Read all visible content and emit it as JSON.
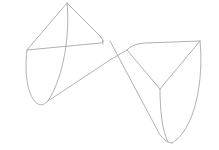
{
  "drawing": {
    "description": "Line sketch of two cone-shaped lobes joined diagonally (wireframe)",
    "stroke_color": "#a8a8a8",
    "stroke_width": 0.9,
    "background": "#ffffff",
    "paths": [
      {
        "name": "left-lobe-apex-to-left-edge",
        "d": "M67,3 L27,50"
      },
      {
        "name": "left-lobe-apex-to-right",
        "d": "M67,3 L101,37 Q104,41 103,44"
      },
      {
        "name": "left-lobe-rim",
        "d": "M27,50 L101,43 Q104,42 103,40"
      },
      {
        "name": "left-lobe-outer-curve",
        "d": "M27,50 C24,75 28,98 38,104 C42,106 45,104 48,101"
      },
      {
        "name": "left-lobe-inner-curve",
        "d": "M67,3 C70,30 65,75 48,101"
      },
      {
        "name": "left-lobe-bottom-to-right",
        "d": "M48,101 L110,60"
      },
      {
        "name": "apex-diagonal-through",
        "d": "M110,41 L160,135 Q166,143 172,143"
      },
      {
        "name": "right-lobe-rim",
        "d": "M110,60 L127,50 Q132,44 145,43 L200,41"
      },
      {
        "name": "right-lobe-inner-top",
        "d": "M127,50 L160,89"
      },
      {
        "name": "right-lobe-center-to-right",
        "d": "M160,89 L200,41"
      },
      {
        "name": "right-lobe-center-down",
        "d": "M160,89 C160,110 162,130 168,142"
      },
      {
        "name": "right-lobe-outer-curve",
        "d": "M200,41 C204,80 195,130 172,143"
      }
    ]
  }
}
